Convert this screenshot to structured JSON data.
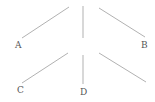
{
  "diagram": {
    "line_color": "#a8a8a8",
    "label_color": "#555555",
    "lines": [
      {
        "name": "line-a",
        "x1": 69,
        "y1": 7,
        "x2": 22,
        "y2": 38
      },
      {
        "name": "line-top-vertical",
        "x1": 83,
        "y1": 6,
        "x2": 83,
        "y2": 38
      },
      {
        "name": "line-b",
        "x1": 99,
        "y1": 8,
        "x2": 145,
        "y2": 37
      },
      {
        "name": "line-c",
        "x1": 68,
        "y1": 53,
        "x2": 22,
        "y2": 83
      },
      {
        "name": "line-d",
        "x1": 83,
        "y1": 55,
        "x2": 83,
        "y2": 84
      },
      {
        "name": "line-bottom-right",
        "x1": 99,
        "y1": 53,
        "x2": 146,
        "y2": 82
      }
    ],
    "labels": {
      "a": "A",
      "b": "B",
      "c": "C",
      "d": "D"
    }
  }
}
